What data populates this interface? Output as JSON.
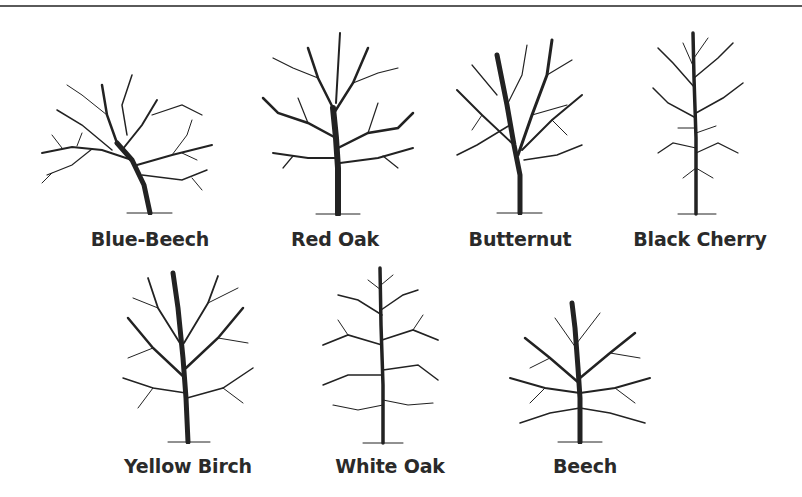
{
  "figure": {
    "top_rule": true,
    "ink_color": "#222222",
    "trees": [
      {
        "id": "blue-beech",
        "label": "Blue-Beech",
        "row": 1,
        "form": "spreading, leaning trunk"
      },
      {
        "id": "red-oak",
        "label": "Red Oak",
        "row": 1,
        "form": "broad rounded crown"
      },
      {
        "id": "butternut",
        "label": "Butternut",
        "row": 1,
        "form": "upright forked vase"
      },
      {
        "id": "black-cherry",
        "label": "Black Cherry",
        "row": 1,
        "form": "narrow tall central trunk"
      },
      {
        "id": "yellow-birch",
        "label": "Yellow Birch",
        "row": 2,
        "form": "dense oval crown"
      },
      {
        "id": "white-oak",
        "label": "White Oak",
        "row": 2,
        "form": "narrow excurrent spire"
      },
      {
        "id": "beech",
        "label": "Beech",
        "row": 2,
        "form": "rounded dense crown"
      }
    ]
  }
}
